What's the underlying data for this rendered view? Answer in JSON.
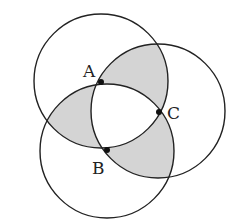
{
  "diagram": {
    "type": "three-circles",
    "stroke_color": "#222222",
    "shade_color": "#d4d4d4",
    "points": [
      {
        "label": "A",
        "x": 101,
        "y": 82,
        "label_x": 83,
        "label_y": 77
      },
      {
        "label": "B",
        "x": 107,
        "y": 150,
        "label_x": 92,
        "label_y": 174
      },
      {
        "label": "C",
        "x": 159,
        "y": 112,
        "label_x": 167,
        "label_y": 119
      }
    ],
    "circles": [
      {
        "center": "A",
        "cx": 101,
        "cy": 81,
        "r": 67
      },
      {
        "center": "B",
        "cx": 107,
        "cy": 151,
        "r": 67
      },
      {
        "center": "C",
        "cx": 158,
        "cy": 111,
        "r": 67
      }
    ],
    "shaded_regions": "each pairwise lens excluding the common triple region"
  }
}
